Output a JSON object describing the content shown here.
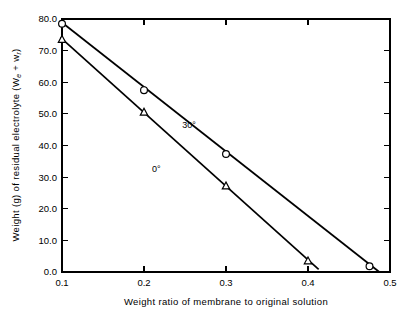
{
  "chart_data": {
    "type": "line",
    "title": "",
    "xlabel": "Weight ratio of membrane to original solution",
    "ylabel": "Weight (g) of residual electrolyte (W",
    "ylabel_sub1": "e",
    "ylabel_mid": " + w",
    "ylabel_sub2": "r",
    "ylabel_end": ")",
    "xlim": [
      0.1,
      0.5
    ],
    "ylim": [
      0.0,
      80.0
    ],
    "grid": false,
    "legend_position": "inline-annotation",
    "xticks": [
      "0.1",
      "0.2",
      "0.3",
      "0.4",
      "0.5"
    ],
    "xtick_values": [
      0.1,
      0.2,
      0.3,
      0.4,
      0.5
    ],
    "yticks": [
      "0.0",
      "10.0",
      "20.0",
      "30.0",
      "40.0",
      "50.0",
      "60.0",
      "70.0",
      "80.0"
    ],
    "ytick_values": [
      0,
      10,
      20,
      30,
      40,
      50,
      60,
      70,
      80
    ],
    "series": [
      {
        "name": "30°",
        "marker": "circle",
        "annotation": "30°",
        "annotation_x": 0.255,
        "annotation_y": 45.5,
        "x": [
          0.1,
          0.2,
          0.3,
          0.475
        ],
        "y": [
          78.5,
          57.5,
          37.3,
          1.8
        ],
        "line_x": [
          0.098,
          0.487
        ],
        "line_y": [
          79.3,
          0.0
        ]
      },
      {
        "name": "0°",
        "marker": "triangle",
        "annotation": "0°",
        "annotation_x": 0.215,
        "annotation_y": 31.5,
        "x": [
          0.1,
          0.2,
          0.3,
          0.4
        ],
        "y": [
          73.5,
          50.5,
          27.2,
          3.5
        ],
        "line_x": [
          0.098,
          0.413
        ],
        "line_y": [
          74.2,
          0.8
        ]
      }
    ]
  },
  "figure": {
    "background_color": "#ffffff",
    "foreground_color": "#000000"
  }
}
